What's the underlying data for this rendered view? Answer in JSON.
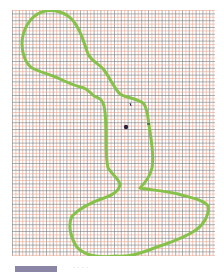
{
  "figure": {
    "grid_line_colors": [
      "#7a7a7a",
      "#e8a58f"
    ],
    "outline_color": "#86c24a",
    "marker_color": "#2b2240"
  },
  "caption": {
    "swatch_color": "#8b86a6",
    "text": "· · · ·"
  }
}
